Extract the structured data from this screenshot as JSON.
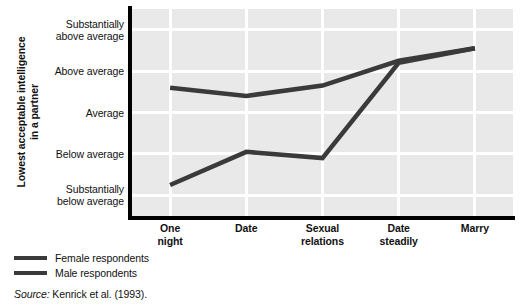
{
  "chart_data": {
    "type": "line",
    "title": "",
    "xlabel": "",
    "ylabel": "Lowest acceptable intelligence in a partner",
    "ylabel_line1": "Lowest acceptable intelligence",
    "ylabel_line2": "in a partner",
    "categories": [
      "One night",
      "Date",
      "Sexual relations",
      "Date steadily",
      "Marry"
    ],
    "category_lines": [
      [
        "One",
        "night"
      ],
      [
        "Date",
        ""
      ],
      [
        "Sexual",
        "relations"
      ],
      [
        "Date",
        "steadily"
      ],
      [
        "Marry",
        ""
      ]
    ],
    "ytick_labels": [
      "Substantially above average",
      "Above average",
      "Average",
      "Below average",
      "Substantially below average"
    ],
    "ytick_lines": [
      [
        "Substantially",
        "above average"
      ],
      [
        "Above average",
        ""
      ],
      [
        "Average",
        ""
      ],
      [
        "Below average",
        ""
      ],
      [
        "Substantially",
        "below average"
      ]
    ],
    "ytick_values": [
      5,
      4,
      3,
      2,
      1
    ],
    "ylim": [
      0.5,
      5.5
    ],
    "grid": true,
    "legend_position": "below-left",
    "series": [
      {
        "name": "Female respondents",
        "color": "#3a3a3a",
        "values": [
          3.6,
          3.4,
          3.65,
          4.25,
          4.55
        ]
      },
      {
        "name": "Male respondents",
        "color": "#3a3a3a",
        "values": [
          1.25,
          2.05,
          1.9,
          4.2,
          4.55
        ]
      }
    ],
    "source": "Source: Kenrick et al. (1993).",
    "source_prefix": "Source:",
    "source_text": " Kenrick et al. (1993)."
  },
  "legend": {
    "items": [
      {
        "label": "Female respondents"
      },
      {
        "label": "Male respondents"
      }
    ]
  },
  "colors": {
    "plot_background": "#e9e9e9",
    "gridline": "#ffffff",
    "axis": "#000000",
    "line": "#3a3a3a",
    "text": "#111111"
  }
}
